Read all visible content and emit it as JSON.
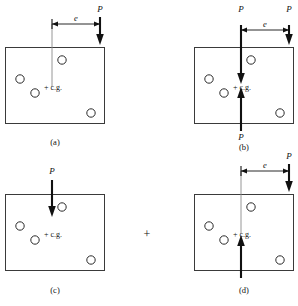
{
  "figure": {
    "type": "engineering-mechanics-diagram",
    "cg_label": "+ c.g.",
    "force_label": "P",
    "eccentricity_label": "e",
    "plus_operator": "+",
    "colors": {
      "plate_stroke": "#3a3a3a",
      "hole_stroke": "#2b2b2b",
      "force": "#111111",
      "extension_line": "#8a8a8a",
      "background": "#ffffff"
    },
    "panels": [
      {
        "id": "a",
        "caption": "(a)",
        "plate": {
          "x": 5,
          "y": 47,
          "width": 100,
          "height": 77
        },
        "holes": [
          {
            "cx": 62,
            "cy": 60,
            "r": 4.2
          },
          {
            "cx": 20,
            "cy": 79,
            "r": 4.2
          },
          {
            "cx": 35,
            "cy": 93,
            "r": 4.2
          },
          {
            "cx": 91,
            "cy": 113,
            "r": 4.2
          }
        ],
        "cg": {
          "x": 52,
          "y": 87
        },
        "forces": [
          {
            "name": "eccentric-load",
            "orientation": "down",
            "x": 100,
            "y_start": 17,
            "y_end": 44,
            "label": "P",
            "label_x": 100,
            "label_y": 11
          }
        ],
        "dimension": {
          "from_x": 52,
          "to_x": 100,
          "y": 24,
          "label": "e",
          "ext_x": 52,
          "ext_y_start": 24,
          "ext_y_end": 87
        }
      },
      {
        "id": "b",
        "caption": "(b)",
        "plate": {
          "x": 194,
          "y": 47,
          "width": 100,
          "height": 77
        },
        "holes": [
          {
            "cx": 251,
            "cy": 60,
            "r": 4.2
          },
          {
            "cx": 209,
            "cy": 79,
            "r": 4.2
          },
          {
            "cx": 224,
            "cy": 93,
            "r": 4.2
          },
          {
            "cx": 280,
            "cy": 113,
            "r": 4.2
          }
        ],
        "cg": {
          "x": 241,
          "y": 87
        },
        "forces": [
          {
            "name": "applied-load-at-cg-down",
            "orientation": "down",
            "x": 241,
            "y_start": 25,
            "y_end": 83,
            "label": "P",
            "label_x": 241,
            "label_y": 12
          },
          {
            "name": "eccentric-load",
            "orientation": "down",
            "x": 289,
            "y_start": 25,
            "y_end": 44,
            "label": "P",
            "label_x": 289,
            "label_y": 12
          },
          {
            "name": "reaction-load-at-cg-up",
            "orientation": "up",
            "x": 241,
            "y_start": 130,
            "y_end": 88,
            "label": "P",
            "label_x": 241,
            "label_y": 139
          }
        ],
        "dimension": {
          "from_x": 241,
          "to_x": 289,
          "y": 30,
          "label": "e",
          "ext_x": 0,
          "ext_y_start": 0,
          "ext_y_end": 0
        }
      },
      {
        "id": "c",
        "caption": "(c)",
        "plate": {
          "x": 5,
          "y": 194,
          "width": 100,
          "height": 77
        },
        "holes": [
          {
            "cx": 62,
            "cy": 207,
            "r": 4.2
          },
          {
            "cx": 20,
            "cy": 226,
            "r": 4.2
          },
          {
            "cx": 35,
            "cy": 240,
            "r": 4.2
          },
          {
            "cx": 91,
            "cy": 260,
            "r": 4.2
          }
        ],
        "cg": {
          "x": 52,
          "y": 234
        },
        "forces": [
          {
            "name": "direct-shear-load",
            "orientation": "down",
            "x": 52,
            "y_start": 180,
            "y_end": 216,
            "label": "P",
            "label_x": 52,
            "label_y": 173
          }
        ],
        "dimension": null
      },
      {
        "id": "d",
        "caption": "(d)",
        "plate": {
          "x": 194,
          "y": 194,
          "width": 100,
          "height": 77
        },
        "holes": [
          {
            "cx": 251,
            "cy": 207,
            "r": 4.2
          },
          {
            "cx": 209,
            "cy": 226,
            "r": 4.2
          },
          {
            "cx": 224,
            "cy": 240,
            "r": 4.2
          },
          {
            "cx": 280,
            "cy": 260,
            "r": 4.2
          }
        ],
        "cg": {
          "x": 241,
          "y": 234
        },
        "forces": [
          {
            "name": "couple-load-down",
            "orientation": "down",
            "x": 289,
            "y_start": 164,
            "y_end": 191,
            "label": "P",
            "label_x": 289,
            "label_y": 158
          },
          {
            "name": "couple-load-up",
            "orientation": "up",
            "x": 241,
            "y_start": 277,
            "y_end": 236,
            "label": "",
            "label_x": 241,
            "label_y": 286
          }
        ],
        "dimension": {
          "from_x": 241,
          "to_x": 289,
          "y": 171,
          "label": "e",
          "ext_x": 241,
          "ext_y_start": 171,
          "ext_y_end": 234
        }
      }
    ],
    "operator": {
      "symbol": "+",
      "x": 147,
      "y": 234
    }
  }
}
